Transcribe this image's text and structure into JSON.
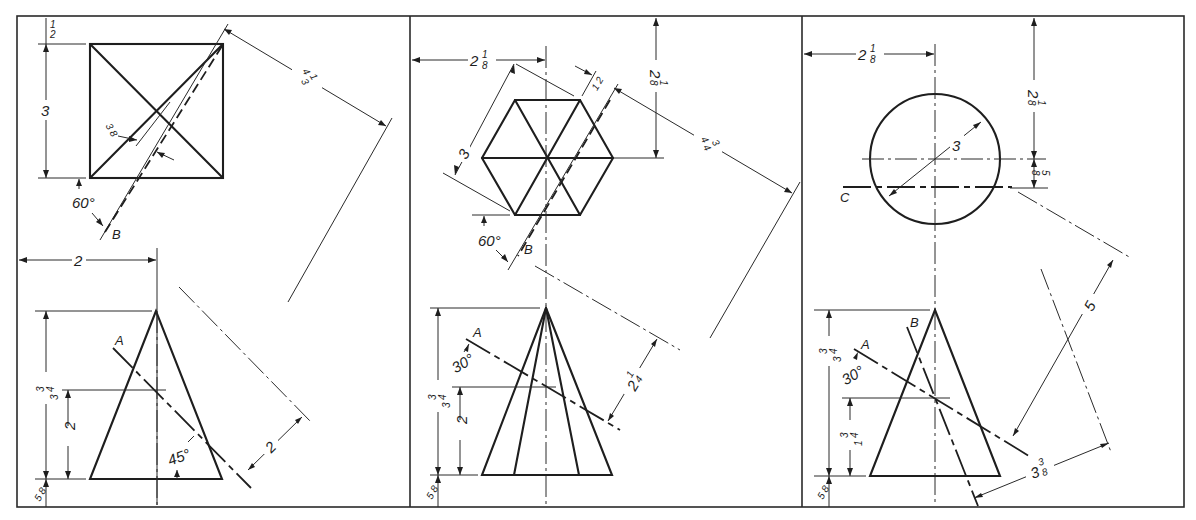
{
  "figure": {
    "type": "orthographic engineering drawing exercise",
    "panels_count": 3
  },
  "panels": [
    {
      "id": "left",
      "top_view": {
        "shape": "square with diagonals",
        "dims": {
          "top_margin": "1/2",
          "side": "3",
          "offset_to_axis": "3/8",
          "aux_distance": "4 1/3"
        },
        "angle": "60°",
        "plane_label": "B"
      },
      "front_view": {
        "shape": "pyramid (triangle)",
        "dims": {
          "horizontal_to_axis": "2",
          "height": "3 3/4",
          "cut_height": "2",
          "bottom_margin": "5/8",
          "aux_distance": "2"
        },
        "angle": "45°",
        "plane_label": "A"
      }
    },
    {
      "id": "middle",
      "top_view": {
        "shape": "hexagon with diagonals",
        "dims": {
          "horizontal_to_axis": "2 1/8",
          "top_to_center": "2 1/8",
          "across_flats": "3",
          "offset": "1/2",
          "aux_distance": "4 3/4"
        },
        "angle": "60°",
        "plane_label": "B"
      },
      "front_view": {
        "shape": "hexagonal pyramid",
        "dims": {
          "height": "3 3/4",
          "cut_height": "2",
          "bottom_margin": "5/8",
          "aux_distance": "2 1/4"
        },
        "angle": "30°",
        "plane_label": "A"
      }
    },
    {
      "id": "right",
      "top_view": {
        "shape": "circle",
        "dims": {
          "horizontal_to_axis": "2 1/8",
          "top_to_center": "2 1/8",
          "diameter": "3",
          "plane_offset": "5/8"
        },
        "plane_label": "C"
      },
      "front_view": {
        "shape": "cone (triangle)",
        "dims": {
          "height": "3 3/4",
          "cut_height": "1 3/4",
          "bottom_margin": "5/8",
          "aux_distance_1": "5",
          "aux_distance_2": "3 3/8"
        },
        "angle": "30°",
        "plane_labels": [
          "A",
          "B"
        ]
      }
    }
  ],
  "text": {
    "p1_half": "1",
    "p1_half_d": "2",
    "p1_three": "3",
    "p1_38_n": "3",
    "p1_38_d": "8",
    "p1_413_w": "4",
    "p1_413_n": "1",
    "p1_413_d": "3",
    "p1_60": "60°",
    "p1_B": "B",
    "p1_two_h": "2",
    "p1_A": "A",
    "p1_334_w": "3",
    "p1_334_n": "3",
    "p1_334_d": "4",
    "p1_two_v": "2",
    "p1_45": "45°",
    "p1_58_n": "5",
    "p1_58_d": "8",
    "p1_two_aux": "2",
    "p2_218_w": "2",
    "p2_218_n": "1",
    "p2_218_d": "8",
    "p2_218v_w": "2",
    "p2_218v_n": "1",
    "p2_218v_d": "8",
    "p2_three": "3",
    "p2_12_n": "1",
    "p2_12_d": "2",
    "p2_434_w": "4",
    "p2_434_n": "3",
    "p2_434_d": "4",
    "p2_60": "60°",
    "p2_B": "B",
    "p2_A": "A",
    "p2_30": "30°",
    "p2_334_w": "3",
    "p2_334_n": "3",
    "p2_334_d": "4",
    "p2_two_v": "2",
    "p2_58_n": "5",
    "p2_58_d": "8",
    "p2_214_w": "2",
    "p2_214_n": "1",
    "p2_214_d": "4",
    "p3_218_w": "2",
    "p3_218_n": "1",
    "p3_218_d": "8",
    "p3_218v_w": "2",
    "p3_218v_n": "1",
    "p3_218v_d": "8",
    "p3_three": "3",
    "p3_58t_n": "5",
    "p3_58t_d": "8",
    "p3_C": "C",
    "p3_B": "B",
    "p3_A": "A",
    "p3_30": "30°",
    "p3_334_w": "3",
    "p3_334_n": "3",
    "p3_334_d": "4",
    "p3_134_w": "1",
    "p3_134_n": "3",
    "p3_134_d": "4",
    "p3_58_n": "5",
    "p3_58_d": "8",
    "p3_five": "5",
    "p3_338_w": "3",
    "p3_338_n": "3",
    "p3_338_d": "8"
  }
}
